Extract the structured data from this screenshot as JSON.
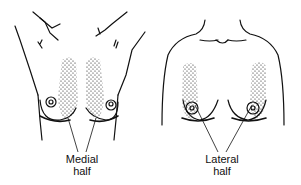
{
  "figures": [
    {
      "id": "left",
      "view": "breasts lifted / arms raised, medial halves stippled",
      "label_line1": "Medial",
      "label_line2": "half"
    },
    {
      "id": "right",
      "view": "frontal torso, lateral halves stippled",
      "label_line1": "Lateral",
      "label_line2": "half"
    }
  ],
  "colors": {
    "ink": "#111111",
    "background": "#ffffff"
  }
}
